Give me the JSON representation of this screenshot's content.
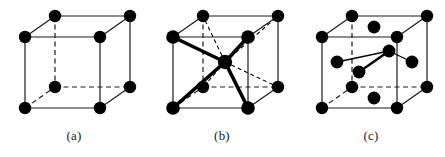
{
  "figure": {
    "background_color": "#ffffff",
    "width": 445,
    "height": 157,
    "edge_color": "#1a1a1a",
    "atom_color": "#000000",
    "bond_color": "#000000"
  },
  "geometry": {
    "front": {
      "left": 25,
      "right": 100,
      "top": 37,
      "bottom": 108
    },
    "back_offset": {
      "dx": 30,
      "dy": -21
    },
    "atom_radius": 6.2,
    "edge_width": 1.2,
    "dash_pattern": "5,3.5",
    "bond_width": 3.6,
    "bond_dash_width": 1.1
  },
  "panels": [
    {
      "id": "a",
      "caption": "(a)",
      "structure": "simple-cubic",
      "name": "simple-cubic-cell",
      "atoms": [
        {
          "name": "corner-front-top-left",
          "x": 25,
          "y": 37,
          "r": 6.2
        },
        {
          "name": "corner-front-top-right",
          "x": 100,
          "y": 37,
          "r": 6.2
        },
        {
          "name": "corner-front-bottom-left",
          "x": 25,
          "y": 108,
          "r": 6.2
        },
        {
          "name": "corner-front-bottom-right",
          "x": 100,
          "y": 108,
          "r": 6.2
        },
        {
          "name": "corner-back-top-left",
          "x": 55,
          "y": 16,
          "r": 6.2
        },
        {
          "name": "corner-back-top-right",
          "x": 130,
          "y": 16,
          "r": 6.2
        },
        {
          "name": "corner-back-bottom-left",
          "x": 55,
          "y": 87,
          "r": 6.2
        },
        {
          "name": "corner-back-bottom-right",
          "x": 130,
          "y": 87,
          "r": 6.2
        }
      ],
      "solid_edges": [
        {
          "name": "edge-front-top",
          "x1": 25,
          "y1": 37,
          "x2": 100,
          "y2": 37
        },
        {
          "name": "edge-front-bottom",
          "x1": 25,
          "y1": 108,
          "x2": 100,
          "y2": 108
        },
        {
          "name": "edge-front-left",
          "x1": 25,
          "y1": 37,
          "x2": 25,
          "y2": 108
        },
        {
          "name": "edge-front-right",
          "x1": 100,
          "y1": 37,
          "x2": 100,
          "y2": 108
        },
        {
          "name": "edge-back-top",
          "x1": 55,
          "y1": 16,
          "x2": 130,
          "y2": 16
        },
        {
          "name": "edge-back-right",
          "x1": 130,
          "y1": 16,
          "x2": 130,
          "y2": 87
        },
        {
          "name": "edge-top-left",
          "x1": 25,
          "y1": 37,
          "x2": 55,
          "y2": 16
        },
        {
          "name": "edge-top-right",
          "x1": 100,
          "y1": 37,
          "x2": 130,
          "y2": 16
        },
        {
          "name": "edge-bottom-right",
          "x1": 100,
          "y1": 108,
          "x2": 130,
          "y2": 87
        }
      ],
      "dashed_edges": [
        {
          "name": "edge-back-left-hidden",
          "x1": 55,
          "y1": 16,
          "x2": 55,
          "y2": 87
        },
        {
          "name": "edge-back-bottom-hidden",
          "x1": 55,
          "y1": 87,
          "x2": 130,
          "y2": 87
        },
        {
          "name": "edge-bottom-left-hidden",
          "x1": 25,
          "y1": 108,
          "x2": 55,
          "y2": 87
        }
      ],
      "bold_bonds": [],
      "dashed_bonds": []
    },
    {
      "id": "b",
      "caption": "(b)",
      "structure": "body-centered-cubic",
      "name": "body-centered-cubic-cell",
      "atoms": [
        {
          "name": "corner-front-top-left",
          "x": 25,
          "y": 37,
          "r": 6.8
        },
        {
          "name": "corner-front-top-right",
          "x": 100,
          "y": 37,
          "r": 6.8
        },
        {
          "name": "corner-front-bottom-left",
          "x": 25,
          "y": 108,
          "r": 6.8
        },
        {
          "name": "corner-front-bottom-right",
          "x": 100,
          "y": 108,
          "r": 6.8
        },
        {
          "name": "corner-back-top-left",
          "x": 55,
          "y": 16,
          "r": 6.2
        },
        {
          "name": "corner-back-top-right",
          "x": 130,
          "y": 16,
          "r": 6.2
        },
        {
          "name": "corner-back-bottom-left",
          "x": 55,
          "y": 87,
          "r": 6.2
        },
        {
          "name": "corner-back-bottom-right",
          "x": 130,
          "y": 87,
          "r": 6.2
        },
        {
          "name": "body-center-atom",
          "x": 77,
          "y": 62,
          "r": 7.2
        }
      ],
      "solid_edges": [
        {
          "name": "edge-front-top",
          "x1": 25,
          "y1": 37,
          "x2": 100,
          "y2": 37
        },
        {
          "name": "edge-front-bottom",
          "x1": 25,
          "y1": 108,
          "x2": 100,
          "y2": 108
        },
        {
          "name": "edge-front-left",
          "x1": 25,
          "y1": 37,
          "x2": 25,
          "y2": 108
        },
        {
          "name": "edge-front-right",
          "x1": 100,
          "y1": 37,
          "x2": 100,
          "y2": 108
        },
        {
          "name": "edge-back-top",
          "x1": 55,
          "y1": 16,
          "x2": 130,
          "y2": 16
        },
        {
          "name": "edge-back-right",
          "x1": 130,
          "y1": 16,
          "x2": 130,
          "y2": 87
        },
        {
          "name": "edge-top-left",
          "x1": 25,
          "y1": 37,
          "x2": 55,
          "y2": 16
        },
        {
          "name": "edge-top-right",
          "x1": 100,
          "y1": 37,
          "x2": 130,
          "y2": 16
        },
        {
          "name": "edge-bottom-right",
          "x1": 100,
          "y1": 108,
          "x2": 130,
          "y2": 87
        }
      ],
      "dashed_edges": [
        {
          "name": "edge-back-left-hidden",
          "x1": 55,
          "y1": 16,
          "x2": 55,
          "y2": 87
        },
        {
          "name": "edge-back-bottom-hidden",
          "x1": 55,
          "y1": 87,
          "x2": 130,
          "y2": 87
        },
        {
          "name": "edge-bottom-left-hidden",
          "x1": 25,
          "y1": 108,
          "x2": 55,
          "y2": 87
        }
      ],
      "bold_bonds": [
        {
          "name": "bond-center-to-front-top-left",
          "x1": 77,
          "y1": 62,
          "x2": 25,
          "y2": 37
        },
        {
          "name": "bond-center-to-front-top-right",
          "x1": 77,
          "y1": 62,
          "x2": 100,
          "y2": 37
        },
        {
          "name": "bond-center-to-front-bottom-left",
          "x1": 77,
          "y1": 62,
          "x2": 25,
          "y2": 108
        },
        {
          "name": "bond-center-to-front-bottom-right",
          "x1": 77,
          "y1": 62,
          "x2": 100,
          "y2": 108
        }
      ],
      "dashed_bonds": [
        {
          "name": "bond-center-to-back-top-left",
          "x1": 77,
          "y1": 62,
          "x2": 55,
          "y2": 16
        },
        {
          "name": "bond-center-to-back-top-right",
          "x1": 77,
          "y1": 62,
          "x2": 130,
          "y2": 16
        },
        {
          "name": "bond-center-to-back-bottom-left",
          "x1": 77,
          "y1": 62,
          "x2": 55,
          "y2": 87
        },
        {
          "name": "bond-center-to-back-bottom-right",
          "x1": 77,
          "y1": 62,
          "x2": 130,
          "y2": 87
        }
      ]
    },
    {
      "id": "c",
      "caption": "(c)",
      "structure": "face-centered-cubic",
      "name": "face-centered-cubic-cell",
      "atoms": [
        {
          "name": "corner-front-top-left",
          "x": 25,
          "y": 37,
          "r": 6.2
        },
        {
          "name": "corner-front-top-right",
          "x": 100,
          "y": 37,
          "r": 6.2
        },
        {
          "name": "corner-front-bottom-left",
          "x": 25,
          "y": 108,
          "r": 6.2
        },
        {
          "name": "corner-front-bottom-right",
          "x": 100,
          "y": 108,
          "r": 6.2
        },
        {
          "name": "corner-back-top-left",
          "x": 55,
          "y": 16,
          "r": 6.2
        },
        {
          "name": "corner-back-top-right",
          "x": 130,
          "y": 16,
          "r": 6.2
        },
        {
          "name": "corner-back-bottom-left",
          "x": 55,
          "y": 87,
          "r": 6.2
        },
        {
          "name": "corner-back-bottom-right",
          "x": 130,
          "y": 87,
          "r": 6.2
        },
        {
          "name": "face-center-top",
          "x": 77,
          "y": 27,
          "r": 6.4
        },
        {
          "name": "face-center-bottom",
          "x": 77,
          "y": 98,
          "r": 6.4
        },
        {
          "name": "face-center-front",
          "x": 62,
          "y": 72,
          "r": 6.4
        },
        {
          "name": "face-center-back",
          "x": 92,
          "y": 51,
          "r": 6.4
        },
        {
          "name": "face-center-left",
          "x": 40,
          "y": 62,
          "r": 6.4
        },
        {
          "name": "face-center-right",
          "x": 115,
          "y": 62,
          "r": 6.4
        }
      ],
      "solid_edges": [
        {
          "name": "edge-front-top",
          "x1": 25,
          "y1": 37,
          "x2": 100,
          "y2": 37
        },
        {
          "name": "edge-front-bottom",
          "x1": 25,
          "y1": 108,
          "x2": 100,
          "y2": 108
        },
        {
          "name": "edge-front-left",
          "x1": 25,
          "y1": 37,
          "x2": 25,
          "y2": 108
        },
        {
          "name": "edge-front-right",
          "x1": 100,
          "y1": 37,
          "x2": 100,
          "y2": 108
        },
        {
          "name": "edge-back-top",
          "x1": 55,
          "y1": 16,
          "x2": 130,
          "y2": 16
        },
        {
          "name": "edge-back-right",
          "x1": 130,
          "y1": 16,
          "x2": 130,
          "y2": 87
        },
        {
          "name": "edge-top-left",
          "x1": 25,
          "y1": 37,
          "x2": 55,
          "y2": 16
        },
        {
          "name": "edge-top-right",
          "x1": 100,
          "y1": 37,
          "x2": 130,
          "y2": 16
        },
        {
          "name": "edge-bottom-right",
          "x1": 100,
          "y1": 108,
          "x2": 130,
          "y2": 87
        }
      ],
      "dashed_edges": [
        {
          "name": "edge-back-left-hidden",
          "x1": 55,
          "y1": 16,
          "x2": 55,
          "y2": 87
        },
        {
          "name": "edge-back-bottom-hidden",
          "x1": 55,
          "y1": 87,
          "x2": 130,
          "y2": 87
        },
        {
          "name": "edge-bottom-left-hidden",
          "x1": 25,
          "y1": 108,
          "x2": 55,
          "y2": 87
        }
      ],
      "bold_bonds": [
        {
          "name": "guide-left-to-center",
          "x1": 40,
          "y1": 62,
          "x2": 92,
          "y2": 51,
          "width": 1.3
        },
        {
          "name": "guide-center-to-right",
          "x1": 92,
          "y1": 51,
          "x2": 115,
          "y2": 62,
          "width": 1.3
        },
        {
          "name": "guide-front-to-back",
          "x1": 62,
          "y1": 72,
          "x2": 92,
          "y2": 51,
          "width": 2.4
        }
      ],
      "dashed_bonds": []
    }
  ]
}
